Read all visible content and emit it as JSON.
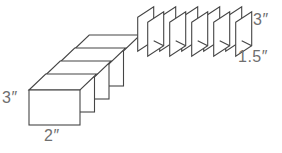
{
  "figure": {
    "colors": {
      "background": "#ffffff",
      "line": "#454545",
      "label": "#6f6f6f"
    },
    "left_group": {
      "type": "open-cards",
      "card_count": 4,
      "height_label": "3″",
      "width_label": "2″"
    },
    "right_group": {
      "type": "folded-cards",
      "card_count": 5,
      "height_label": "3″",
      "width_label": "1.5″"
    }
  }
}
